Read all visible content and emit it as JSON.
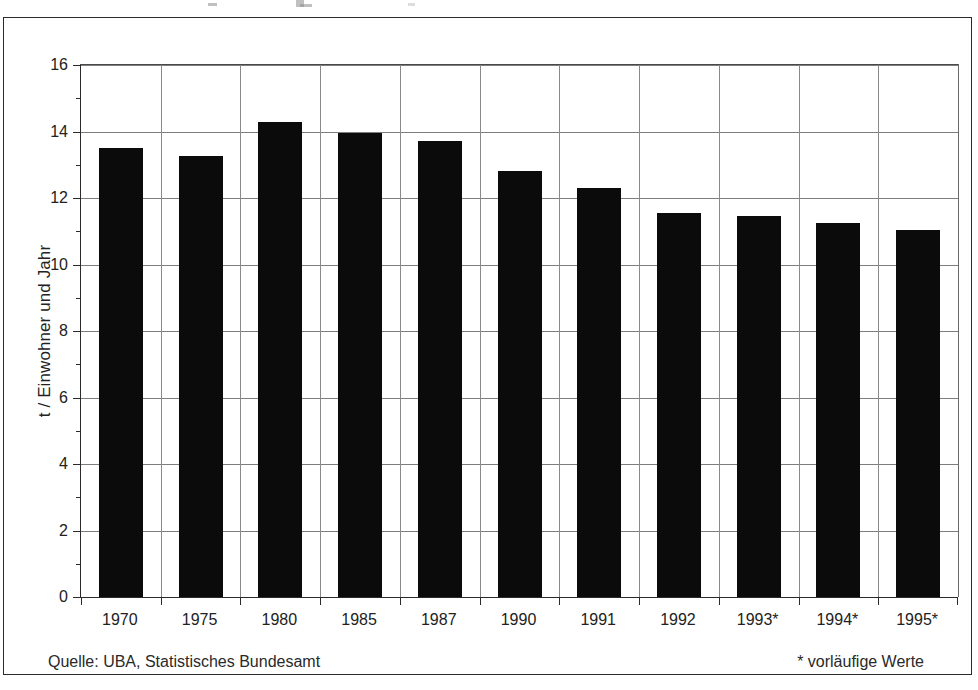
{
  "figure": {
    "source_note": "Quelle: UBA, Statistisches Bundesamt",
    "provisional_note": "* vorläufige Werte"
  },
  "chart_data": {
    "type": "bar",
    "title": "",
    "xlabel": "",
    "ylabel": "t / Einwohner und Jahr",
    "categories": [
      "1970",
      "1975",
      "1980",
      "1985",
      "1987",
      "1990",
      "1991",
      "1992",
      "1993*",
      "1994*",
      "1995*"
    ],
    "values": [
      13.5,
      13.25,
      14.3,
      13.95,
      13.7,
      12.8,
      12.3,
      11.55,
      11.45,
      11.25,
      11.05
    ],
    "ylim": [
      0,
      16
    ],
    "ytick_labels": [
      "0",
      "2",
      "4",
      "6",
      "8",
      "10",
      "12",
      "14",
      "16"
    ],
    "ytick_values": [
      0,
      2,
      4,
      6,
      8,
      10,
      12,
      14,
      16
    ],
    "yminor_tick_values": [
      1,
      3,
      5,
      7,
      9,
      11,
      13,
      15
    ],
    "grid": true,
    "grid_axis": "both",
    "legend": "none",
    "bar_color": "#0b0b0b",
    "axis_color": "#2b2b2b",
    "grid_color": "#7d7d7d"
  }
}
